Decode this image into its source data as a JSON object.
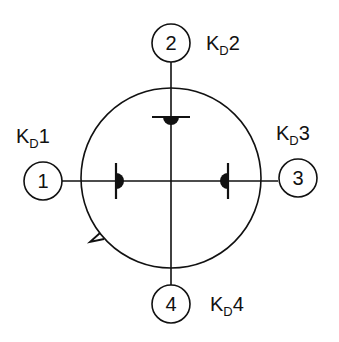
{
  "diagram": {
    "colors": {
      "stroke": "#111111",
      "background": "#ffffff"
    },
    "terminals": [
      {
        "id": "1",
        "label": "1",
        "kd_main": "K",
        "kd_sub": "D",
        "kd_num": "1"
      },
      {
        "id": "2",
        "label": "2",
        "kd_main": "K",
        "kd_sub": "D",
        "kd_num": "2"
      },
      {
        "id": "3",
        "label": "3",
        "kd_main": "K",
        "kd_sub": "D",
        "kd_num": "3"
      },
      {
        "id": "4",
        "label": "4",
        "kd_main": "K",
        "kd_sub": "D",
        "kd_num": "4"
      }
    ]
  }
}
